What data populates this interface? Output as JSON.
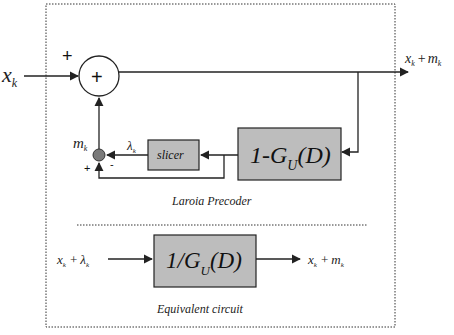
{
  "diagram": {
    "colors": {
      "block_fill": "#bdbdbd",
      "block_stroke": "#222222",
      "node_fill": "#7a7a7a",
      "line": "#222222",
      "dotted_border": "#333333"
    },
    "input_label_main": "x",
    "input_label_sub": "k",
    "summer": {
      "symbol": "+",
      "top_input_sign": "+"
    },
    "output_label": {
      "x": "x",
      "x_sub": "k",
      "op": "+",
      "m": "m",
      "m_sub": "k"
    },
    "node_label": {
      "m": "m",
      "m_sub": "k"
    },
    "node_signs": {
      "plus": "+",
      "minus": "-"
    },
    "lambda_label": {
      "sym": "λ",
      "sub": "k"
    },
    "slicer_block": {
      "label": "slicer"
    },
    "feedback_block": {
      "label_pre": "1-G",
      "label_sub": "U",
      "label_post": "(D)"
    },
    "precoder_caption": "Laroia Precoder",
    "equivalent": {
      "input": {
        "x": "x",
        "x_sub": "k",
        "op": "+",
        "lam": "λ",
        "lam_sub": "k"
      },
      "block": {
        "label_pre": "1/G",
        "label_sub": "U",
        "label_post": "(D)"
      },
      "output": {
        "x": "x",
        "x_sub": "k",
        "op": "+",
        "m": "m",
        "m_sub": "k"
      },
      "caption": "Equivalent circuit"
    }
  }
}
